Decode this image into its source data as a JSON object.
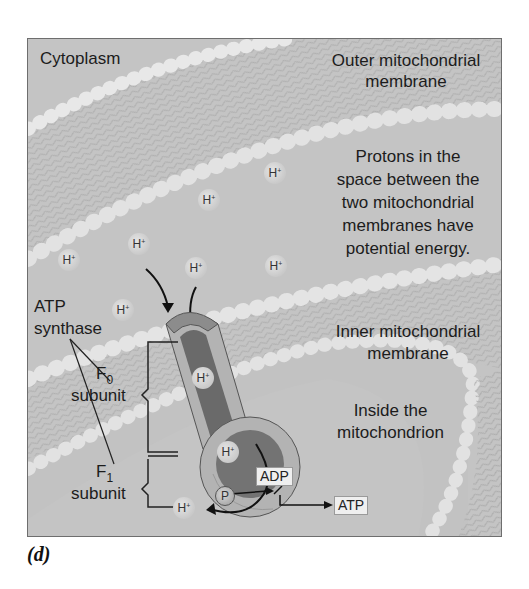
{
  "figure": {
    "panel_label": "(d)",
    "labels": {
      "cytoplasm": "Cytoplasm",
      "outer_membrane_line1": "Outer mitochondrial",
      "outer_membrane_line2": "membrane",
      "protons_line1": "Protons in the",
      "protons_line2": "space between the",
      "protons_line3": "two mitochondrial",
      "protons_line4": "membranes have",
      "protons_line5": "potential energy.",
      "inner_membrane_line1": "Inner mitochondrial",
      "inner_membrane_line2": "membrane",
      "inside_line1": "Inside the",
      "inside_line2": "mitochondrion",
      "atp_synthase_line1": "ATP",
      "atp_synthase_line2": "synthase",
      "f0_letter": "F",
      "f0_sub": "0",
      "f0_word": "subunit",
      "f1_letter": "F",
      "f1_sub": "1",
      "f1_word": "subunit",
      "adp": "ADP",
      "atp": "ATP",
      "phosphate": "P"
    },
    "proton": {
      "symbol": "H",
      "charge": "+"
    },
    "colors": {
      "background": "#c4c4c4",
      "membrane_bead": "#e4e4e4",
      "channel_dark": "#6a6a6a",
      "channel_light": "#b3b3b3",
      "cap": "#8c8c8c",
      "text": "#1c1c1c"
    }
  }
}
